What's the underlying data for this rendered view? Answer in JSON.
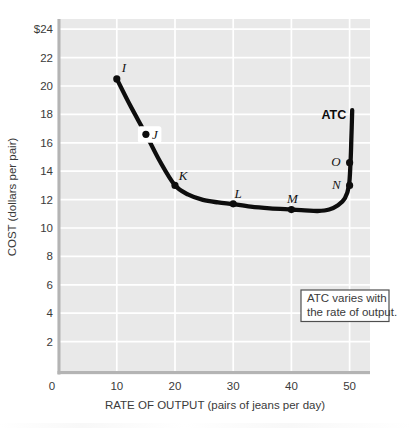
{
  "figure": {
    "kind": "economics-textbook-figure",
    "annotation_lines": [
      "ATC varies with",
      "the rate of output."
    ]
  },
  "colors": {
    "plot_bg": "#e9e9e9",
    "gridline": "#ffffff",
    "axis": "#b4b4b4",
    "curve": "#0d0d0d",
    "text": "#3a3a3a",
    "point_label": "#141414",
    "annotation_border": "#4f4f4f",
    "annotation_bg": "#ffffff"
  },
  "chart_data": {
    "type": "line",
    "title": "",
    "xlabel": "RATE OF OUTPUT (pairs of jeans per day)",
    "ylabel": "COST (dollars per pair)",
    "xlim": [
      0,
      53.5
    ],
    "ylim": [
      0,
      24.7
    ],
    "grid": true,
    "x_ticks": [
      0,
      10,
      20,
      30,
      40,
      50
    ],
    "x_tick_labels": [
      "0",
      "10",
      "20",
      "30",
      "40",
      "50"
    ],
    "y_ticks": [
      2,
      4,
      6,
      8,
      10,
      12,
      14,
      16,
      18,
      20,
      22,
      24
    ],
    "y_tick_labels": [
      "2",
      "4",
      "6",
      "8",
      "10",
      "12",
      "14",
      "16",
      "18",
      "20",
      "22",
      "$24"
    ],
    "series": [
      {
        "name": "ATC",
        "curve": [
          [
            10,
            20.5
          ],
          [
            12.4,
            18.55
          ],
          [
            15,
            16.6
          ],
          [
            17.4,
            14.7
          ],
          [
            20,
            13.0
          ],
          [
            22.3,
            12.35
          ],
          [
            24.8,
            11.98
          ],
          [
            27.4,
            11.8
          ],
          [
            30,
            11.68
          ],
          [
            33,
            11.5
          ],
          [
            36.3,
            11.38
          ],
          [
            40,
            11.3
          ],
          [
            42.3,
            11.24
          ],
          [
            44.5,
            11.2
          ],
          [
            46.5,
            11.3
          ],
          [
            48.0,
            11.6
          ],
          [
            49.2,
            12.1
          ],
          [
            49.9,
            13.0
          ],
          [
            50.15,
            14.6
          ],
          [
            50.3,
            16.2
          ],
          [
            50.45,
            18.3
          ]
        ]
      }
    ],
    "points": [
      {
        "label": "I",
        "x": 10,
        "y": 20.5,
        "anchor": "middle",
        "dx": 7,
        "dy": -7,
        "halo": false
      },
      {
        "label": "J",
        "x": 15,
        "y": 16.6,
        "anchor": "start",
        "dx": 6,
        "dy": 4.5,
        "halo": true
      },
      {
        "label": "K",
        "x": 20,
        "y": 13.0,
        "anchor": "middle",
        "dx": 8,
        "dy": -5,
        "halo": false
      },
      {
        "label": "L",
        "x": 30,
        "y": 11.7,
        "anchor": "middle",
        "dx": 5,
        "dy": -6,
        "halo": false
      },
      {
        "label": "M",
        "x": 40,
        "y": 11.3,
        "anchor": "middle",
        "dx": 1,
        "dy": -6.5,
        "halo": false
      },
      {
        "label": "N",
        "x": 50,
        "y": 13.0,
        "anchor": "end",
        "dx": -9,
        "dy": 3.5,
        "halo": false
      },
      {
        "label": "O",
        "x": 50,
        "y": 14.6,
        "anchor": "end",
        "dx": -9,
        "dy": 3.5,
        "halo": false
      }
    ],
    "curve_label": {
      "text": "ATC",
      "x": 50.45,
      "y": 18.3,
      "dx": -6,
      "dy": 9
    },
    "annotation": {
      "lines": [
        "ATC varies with",
        "the rate of output."
      ]
    },
    "legend": null
  }
}
